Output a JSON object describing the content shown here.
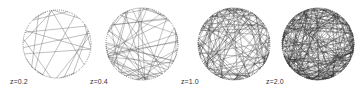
{
  "figure": {
    "panels": [
      {
        "label": "z=0.2",
        "cx": 57,
        "cy": 44,
        "r": 34,
        "lines": 22,
        "seed": 3,
        "label_x": 10,
        "stroke": "#555555",
        "opacity": 0.75
      },
      {
        "label": "z=0.4",
        "cx": 142,
        "cy": 44,
        "r": 36,
        "lines": 55,
        "seed": 7,
        "label_x": 90,
        "stroke": "#555555",
        "opacity": 0.7
      },
      {
        "label": "z=1.0",
        "cx": 234,
        "cy": 44,
        "r": 36,
        "lines": 120,
        "seed": 11,
        "label_x": 181,
        "stroke": "#3a3a3a",
        "opacity": 0.65
      },
      {
        "label": "z=2.0",
        "cx": 318,
        "cy": 44,
        "r": 36,
        "lines": 240,
        "seed": 17,
        "label_x": 266,
        "stroke": "#2a2a2a",
        "opacity": 0.6
      }
    ],
    "label_y": 78,
    "boundary_color": "#555555"
  }
}
